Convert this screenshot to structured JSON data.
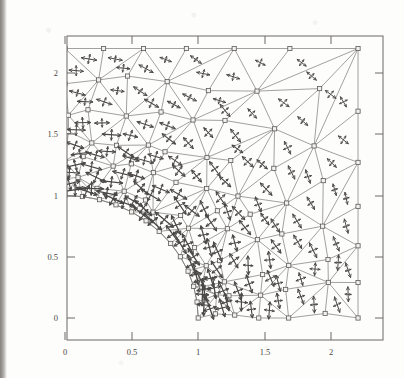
{
  "figure": {
    "kind": "fem-principal-stress-plot",
    "title": "",
    "caption": ""
  },
  "axes": {
    "x_ticks": [
      "0",
      "0.5",
      "1",
      "1.5",
      "2"
    ],
    "x_tick_values": [
      0,
      0.5,
      1,
      1.5,
      2
    ],
    "y_ticks": [
      "0",
      "0.5",
      "1",
      "1.5",
      "2"
    ],
    "y_tick_values": [
      0,
      0.5,
      1,
      1.5,
      2
    ],
    "xlabel": "",
    "ylabel": "",
    "xlim": [
      -0.08,
      2.32
    ],
    "ylim": [
      -0.18,
      2.32
    ],
    "frame": true,
    "grid": false,
    "tick_direction": "in"
  },
  "colors": {
    "frame": "#6b6965",
    "mesh": "#7a7874",
    "node_marker_edge": "#5d5b57",
    "node_marker_fill": "#f2f1ee",
    "glyph": "#4a4846",
    "tick_label": "#4a4744",
    "background": "#fdfdfc"
  },
  "chart_data": {
    "type": "scatter",
    "title": "",
    "xlabel": "",
    "ylabel": "",
    "xlim": [
      -0.08,
      2.32
    ],
    "ylim": [
      -0.18,
      2.32
    ],
    "grid": false,
    "legend": "none",
    "domain": {
      "outer_square": {
        "x_min": 0.0,
        "x_max": 2.2,
        "y_min": 0.0,
        "y_max": 2.2
      },
      "hole": {
        "shape": "quarter-circle",
        "center": [
          0.0,
          0.0
        ],
        "radius": 1.0
      }
    },
    "nodes": [
      [
        0.0,
        2.2
      ],
      [
        0.5,
        2.2
      ],
      [
        1.1,
        2.2
      ],
      [
        1.65,
        2.2
      ],
      [
        2.2,
        2.2
      ],
      [
        0.0,
        1.75
      ],
      [
        0.42,
        1.78
      ],
      [
        0.95,
        1.82
      ],
      [
        1.5,
        1.8
      ],
      [
        2.2,
        1.65
      ],
      [
        0.0,
        1.38
      ],
      [
        0.38,
        1.44
      ],
      [
        0.88,
        1.45
      ],
      [
        1.42,
        1.42
      ],
      [
        1.95,
        1.42
      ],
      [
        2.2,
        1.2
      ],
      [
        0.0,
        1.15
      ],
      [
        0.22,
        1.18
      ],
      [
        0.58,
        1.2
      ],
      [
        1.02,
        1.18
      ],
      [
        1.48,
        1.12
      ],
      [
        1.92,
        1.1
      ],
      [
        2.2,
        0.95
      ],
      [
        0.0,
        1.0
      ],
      [
        0.18,
        1.05
      ],
      [
        0.45,
        1.02
      ],
      [
        0.78,
        1.0
      ],
      [
        1.12,
        0.95
      ],
      [
        1.55,
        0.88
      ],
      [
        1.98,
        0.82
      ],
      [
        0.3,
        0.9
      ],
      [
        0.58,
        0.82
      ],
      [
        0.85,
        0.76
      ],
      [
        1.2,
        0.7
      ],
      [
        1.6,
        0.62
      ],
      [
        2.05,
        0.58
      ],
      [
        2.2,
        0.55
      ],
      [
        0.72,
        0.6
      ],
      [
        0.98,
        0.52
      ],
      [
        1.3,
        0.45
      ],
      [
        1.7,
        0.38
      ],
      [
        2.1,
        0.3
      ],
      [
        0.92,
        0.32
      ],
      [
        1.15,
        0.22
      ],
      [
        1.45,
        0.15
      ],
      [
        1.8,
        0.08
      ],
      [
        2.2,
        0.05
      ],
      [
        1.0,
        0.0
      ],
      [
        1.25,
        0.0
      ],
      [
        1.55,
        0.0
      ],
      [
        1.9,
        0.0
      ],
      [
        2.2,
        0.0
      ]
    ],
    "node_marker": "square",
    "node_count": 52,
    "element_type": "triangle",
    "stress_glyphs": {
      "symbol": "double-headed-arrow-cross",
      "meaning": "principal stress directions and magnitudes at element centroids",
      "count": 78
    }
  }
}
